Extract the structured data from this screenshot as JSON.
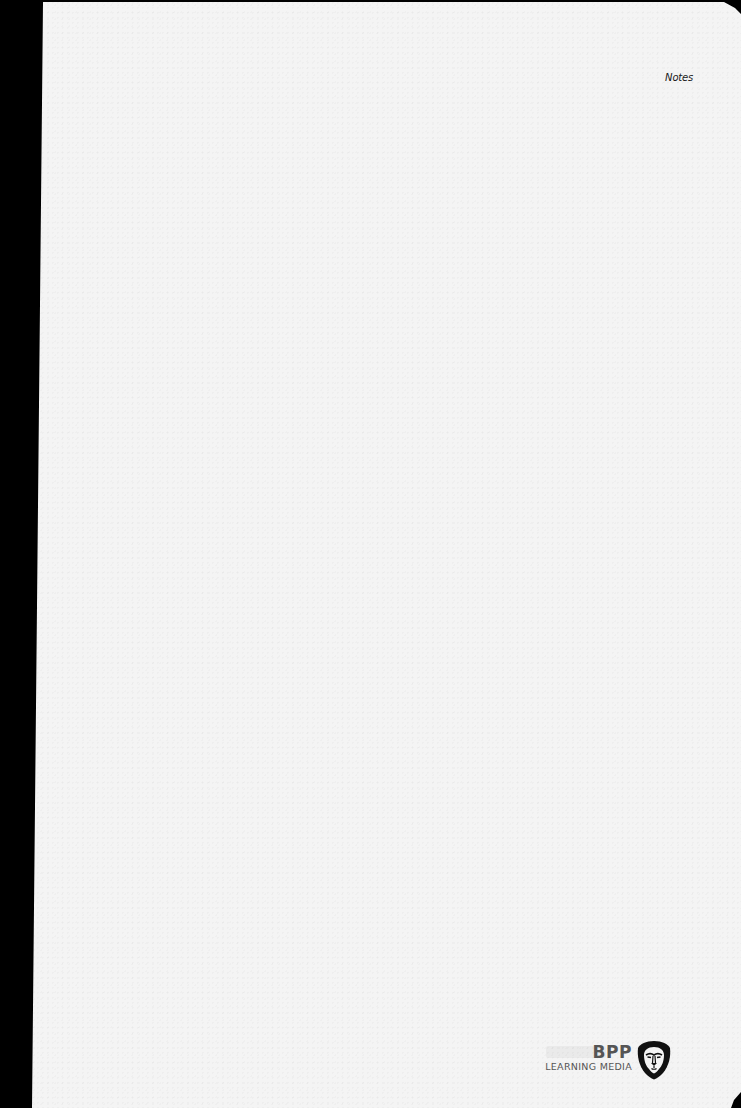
{
  "page": {
    "type": "blank notes page",
    "header": {
      "section_label": "Notes"
    },
    "footer": {
      "publisher": {
        "name": "BPP",
        "subtitle": "LEARNING MEDIA",
        "logo_icon": "lion-head-shield-icon"
      }
    }
  },
  "colors": {
    "paper": "#f4f4f4",
    "binding_edge": "#000000",
    "text": "#1a1a1a",
    "logo_text": "#555555",
    "logo_icon": "#111111"
  }
}
